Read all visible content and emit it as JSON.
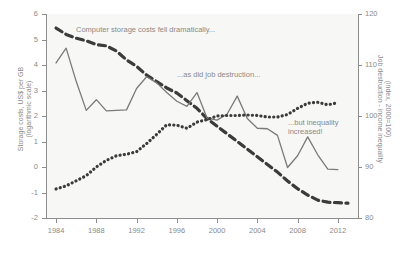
{
  "chart_data": {
    "type": "line",
    "title": "",
    "xlabel": "",
    "ylabel": "Storage costs, US$ per GB (logarithmic scale)",
    "ylabel_right": "Job destruction - income inequality (index, 2000=100)",
    "xlim": [
      1983,
      2014
    ],
    "ylim": [
      -2,
      6
    ],
    "ylim_right": [
      80,
      120
    ],
    "xticks": [
      "1984",
      "1988",
      "1992",
      "1996",
      "2000",
      "2004",
      "2008",
      "2012"
    ],
    "xtick_values": [
      1984,
      1988,
      1992,
      1996,
      2000,
      2004,
      2008,
      2012
    ],
    "yticks_left": [
      "6",
      "5",
      "4",
      "3",
      "2",
      "1",
      "0",
      "-1",
      "-2"
    ],
    "ytick_left_values": [
      6,
      5,
      4,
      3,
      2,
      1,
      0,
      -1,
      -2
    ],
    "yticks_right": [
      "120",
      "110",
      "100",
      "90",
      "80"
    ],
    "ytick_right_values": [
      120,
      110,
      100,
      90,
      80
    ],
    "grid": false,
    "legend_position": "none",
    "annotations": [
      "Computer storage costs fell dramatically...",
      "...as did job destruction...",
      "...but inequality",
      "increased!"
    ],
    "series": [
      {
        "name": "Computer storage costs",
        "axis": "left",
        "style": "dashed",
        "color": "#3b3b3b",
        "x": [
          1984,
          1985,
          1986,
          1987,
          1988,
          1989,
          1990,
          1991,
          1992,
          1993,
          1994,
          1995,
          1996,
          1997,
          1998,
          1999,
          2000,
          2001,
          2002,
          2003,
          2004,
          2005,
          2006,
          2007,
          2008,
          2009,
          2010,
          2011,
          2012,
          2013
        ],
        "values": [
          5.45,
          5.2,
          5.05,
          4.95,
          4.8,
          4.75,
          4.55,
          4.2,
          3.95,
          3.6,
          3.35,
          3.1,
          2.9,
          2.6,
          2.3,
          1.9,
          1.6,
          1.3,
          1.0,
          0.7,
          0.4,
          0.1,
          -0.2,
          -0.55,
          -0.85,
          -1.1,
          -1.3,
          -1.38,
          -1.4,
          -1.42
        ]
      },
      {
        "name": "Job destruction",
        "axis": "right",
        "style": "solid",
        "color": "#7a7a7a",
        "x": [
          1984,
          1985,
          1986,
          1987,
          1988,
          1989,
          1990,
          1991,
          1992,
          1993,
          1994,
          1995,
          1996,
          1997,
          1998,
          1999,
          2000,
          2001,
          2002,
          2003,
          2004,
          2005,
          2006,
          2007,
          2008,
          2009,
          2010,
          2011,
          2012
        ],
        "values": [
          110.4,
          113.3,
          106.8,
          101.1,
          103.2,
          101.0,
          101.1,
          101.2,
          105.4,
          107.7,
          106.5,
          104.6,
          102.9,
          101.9,
          104.6,
          99.6,
          99.2,
          100.4,
          103.9,
          99.5,
          97.6,
          97.5,
          96.2,
          89.9,
          92.2,
          95.9,
          92.4,
          89.6,
          89.5
        ]
      },
      {
        "name": "Income inequality",
        "axis": "right",
        "style": "dotted",
        "color": "#3b3b3b",
        "x": [
          1984,
          1985,
          1986,
          1987,
          1988,
          1989,
          1990,
          1991,
          1992,
          1993,
          1994,
          1995,
          1996,
          1997,
          1998,
          1999,
          2000,
          2001,
          2002,
          2003,
          2004,
          2005,
          2006,
          2007,
          2008,
          2009,
          2010,
          2011,
          2012
        ],
        "values": [
          85.7,
          86.3,
          87.3,
          88.3,
          90.0,
          91.3,
          92.2,
          92.5,
          93.0,
          94.6,
          96.4,
          98.3,
          98.2,
          97.6,
          98.8,
          99.3,
          100.0,
          100.1,
          100.1,
          100.2,
          100.1,
          99.8,
          99.8,
          100.3,
          101.5,
          102.5,
          102.7,
          102.2,
          102.6
        ]
      }
    ]
  }
}
